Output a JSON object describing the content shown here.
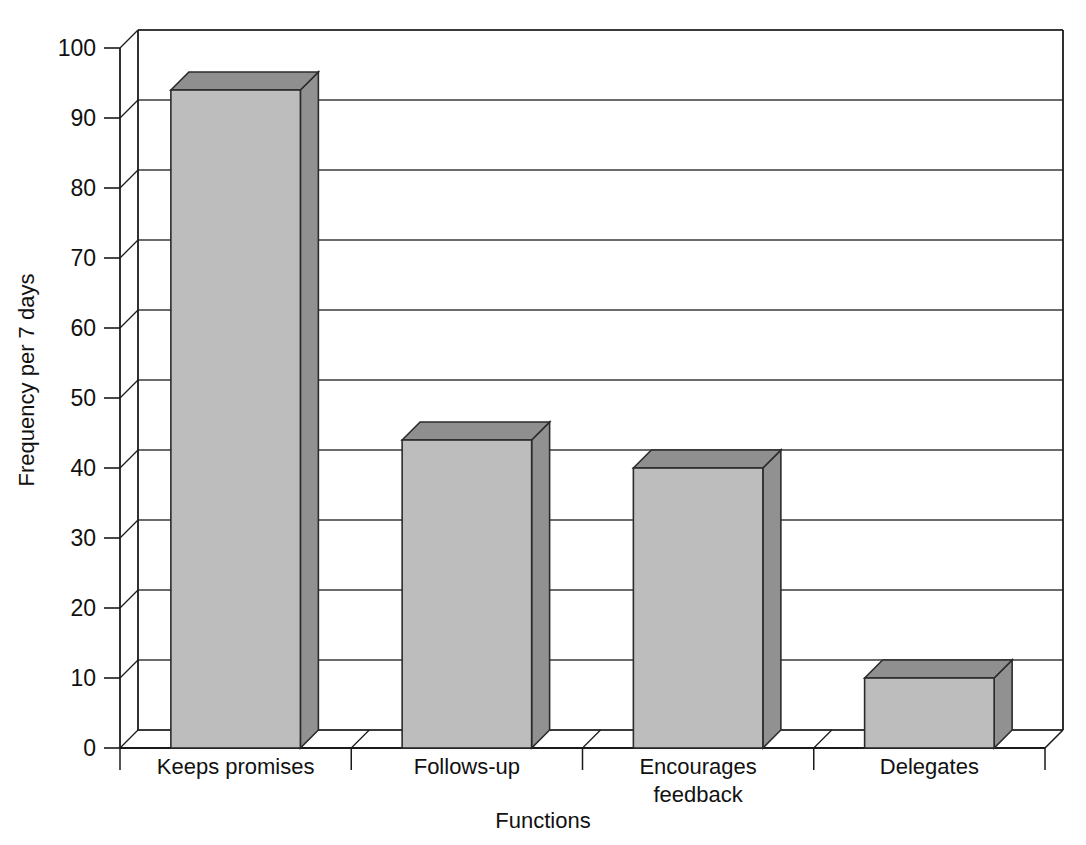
{
  "chart_data": {
    "type": "bar",
    "title": "",
    "subtitle": "",
    "xlabel": "Functions",
    "ylabel": "Frequency per 7 days",
    "categories": [
      "Keeps promises",
      "Follows-up",
      "Encourages feedback",
      "Delegates"
    ],
    "category_lines": [
      [
        "Keeps promises"
      ],
      [
        "Follows-up"
      ],
      [
        "Encourages",
        "feedback"
      ],
      [
        "Delegates"
      ]
    ],
    "values": [
      94,
      44,
      40,
      10
    ],
    "ylim": [
      0,
      100
    ],
    "ytick_labels": [
      "0",
      "10",
      "20",
      "30",
      "40",
      "50",
      "60",
      "70",
      "80",
      "90",
      "100"
    ],
    "ytick_values": [
      0,
      10,
      20,
      30,
      40,
      50,
      60,
      70,
      80,
      90,
      100
    ],
    "grid": true,
    "legend": "none",
    "style": "3d-column",
    "series": [
      {
        "name": "Frequency per 7 days",
        "values": [
          94,
          44,
          40,
          10
        ]
      }
    ],
    "colors": {
      "bar_front": "#bdbdbd",
      "bar_top": "#8f8f8f",
      "bar_side": "#919191",
      "bar_outline": "#2b2b2b",
      "gridline": "#3a3a3a",
      "axis": "#1a1a1a",
      "background": "#ffffff",
      "text": "#111111"
    }
  }
}
